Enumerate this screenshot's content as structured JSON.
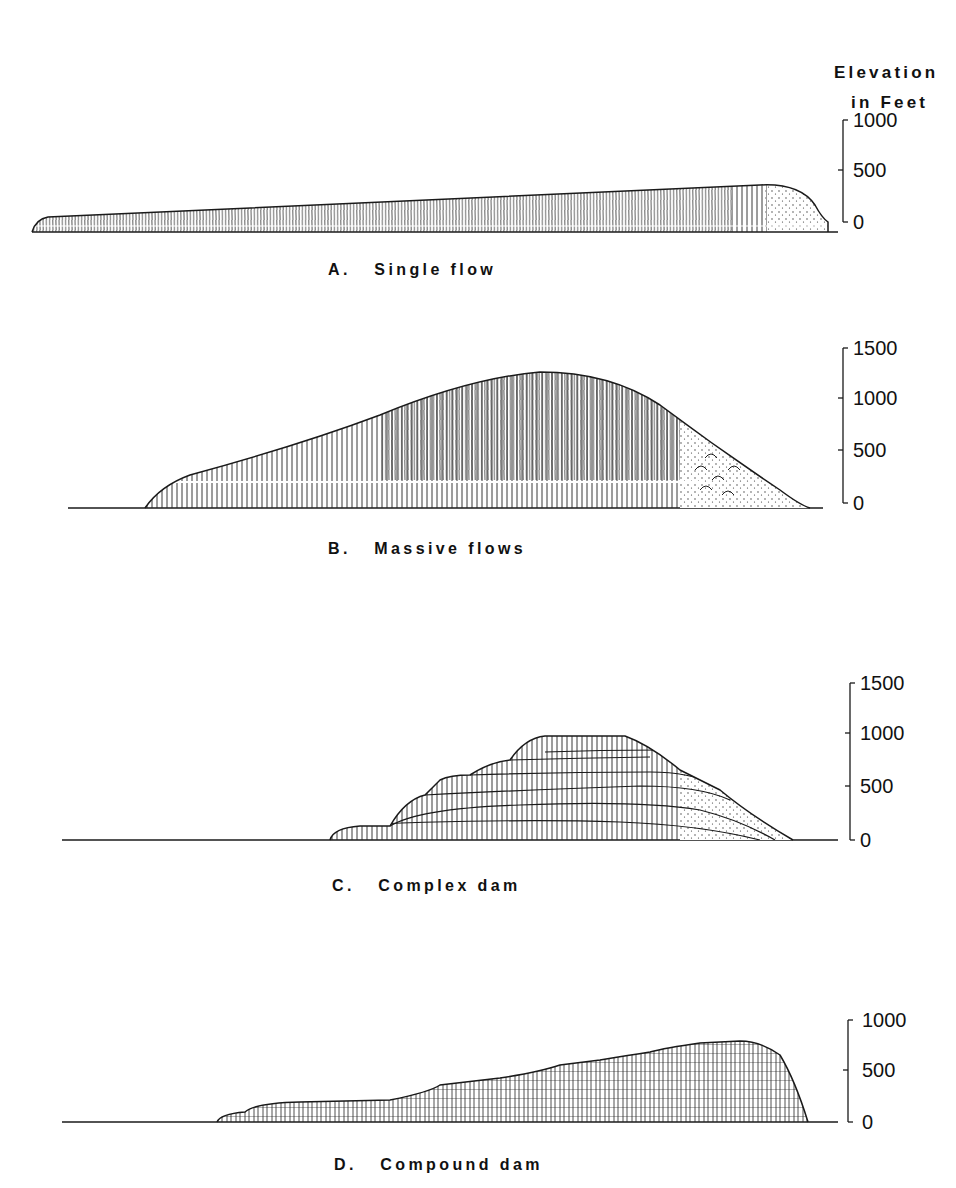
{
  "figure": {
    "axis_title_line1": "Elevation",
    "axis_title_line2": "in Feet",
    "line_color": "#1a1a1a",
    "background": "#ffffff"
  },
  "panels": [
    {
      "id": "A",
      "label": "A.   Single flow",
      "ticks": [
        "1000",
        "500",
        "0"
      ],
      "tick_values": [
        1000,
        500,
        0
      ],
      "description": "Thin single lava flow profile, tapering long distance, blunt front"
    },
    {
      "id": "B",
      "label": "B.   Massive flows",
      "ticks": [
        "1500",
        "1000",
        "500",
        "0"
      ],
      "tick_values": [
        1500,
        1000,
        500,
        0
      ],
      "description": "Thick massive flow profile with columnar jointing and talus breccia at front"
    },
    {
      "id": "C",
      "label": "C.   Complex dam",
      "ticks": [
        "1500",
        "1000",
        "500",
        "0"
      ],
      "tick_values": [
        1500,
        1000,
        500,
        0
      ],
      "description": "Stacked flows forming complex dam with breccia front"
    },
    {
      "id": "D",
      "label": "D.   Compound dam",
      "ticks": [
        "1000",
        "500",
        "0"
      ],
      "tick_values": [
        1000,
        500,
        0
      ],
      "description": "Many thin stacked flows forming compound dam"
    }
  ]
}
